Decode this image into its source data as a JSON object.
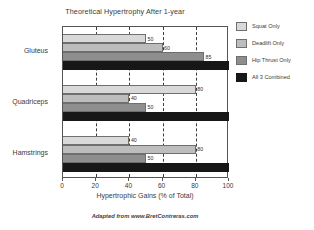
{
  "chart_data": {
    "type": "bar",
    "orientation": "horizontal",
    "title": "Theoretical Hypertrophy After 1-year",
    "xlabel": "Hypertrophic Gains (% of Total)",
    "ylabel": "",
    "xlim": [
      0,
      100
    ],
    "xticks": [
      0,
      20,
      40,
      60,
      80,
      100
    ],
    "xticklabels": [
      "0",
      "20",
      "40",
      "60",
      "80",
      "100"
    ],
    "grid": true,
    "grid_style": "dashed-vertical",
    "legend_position": "right",
    "categories": [
      "Gluteus",
      "Quadriceps",
      "Hamstrings"
    ],
    "series": [
      {
        "name": "Squat Only",
        "color": "#d9d9d9",
        "values": [
          50,
          80,
          40
        ],
        "labels": [
          "50",
          "80",
          "40"
        ]
      },
      {
        "name": "Deadlift Only",
        "color": "#bdbdbd",
        "values": [
          60,
          40,
          80
        ],
        "labels": [
          "60",
          "40",
          "80"
        ]
      },
      {
        "name": "Hip Thrust Only",
        "color": "#8e8e8e",
        "values": [
          85,
          50,
          50
        ],
        "labels": [
          "85",
          "50",
          "50"
        ]
      },
      {
        "name": "All 3 Combined",
        "color": "#171717",
        "values": [
          100,
          100,
          100
        ],
        "labels": [
          "",
          "",
          ""
        ]
      }
    ],
    "source_note": "Adapted from www.BretContreras.com"
  },
  "legend": {
    "items": [
      {
        "label": "Squat Only"
      },
      {
        "label": "Deadlift Only"
      },
      {
        "label": "Hip Thrust Only"
      },
      {
        "label": "All 3 Combined"
      }
    ]
  }
}
